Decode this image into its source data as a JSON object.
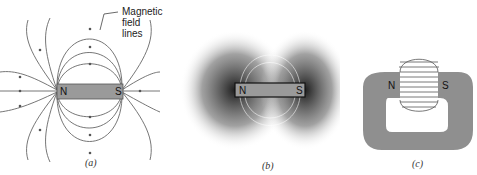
{
  "panels": [
    {
      "id": "a",
      "caption": "(a)",
      "annotation": [
        "Magnetic",
        "field lines"
      ],
      "poles": {
        "north": "N",
        "south": "S"
      }
    },
    {
      "id": "b",
      "caption": "(b)",
      "poles": {
        "north": "N",
        "south": "S"
      }
    },
    {
      "id": "c",
      "caption": "(c)",
      "poles": {
        "north": "N",
        "south": "S"
      }
    }
  ],
  "colors": {
    "magnet": "#9a9a9a",
    "horseshoe": "#8f8f8f",
    "lines": "#555555",
    "filings": "#222222"
  }
}
